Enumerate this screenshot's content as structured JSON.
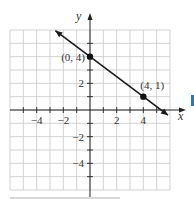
{
  "figure": {
    "type": "coordinate-graph",
    "axes": {
      "x_label": "x",
      "y_label": "y",
      "x_range": [
        -6,
        6
      ],
      "y_range": [
        -6,
        6
      ],
      "x_tick_labels": [
        {
          "value": -4,
          "label": "−4"
        },
        {
          "value": -2,
          "label": "−2"
        },
        {
          "value": 2,
          "label": "2"
        },
        {
          "value": 4,
          "label": "4"
        }
      ],
      "y_tick_labels": [
        {
          "value": 2,
          "label": "2"
        },
        {
          "value": -2,
          "label": "−2"
        },
        {
          "value": -4,
          "label": "−4"
        }
      ],
      "grid": true
    },
    "line": {
      "slope": -0.75,
      "intercept": 4,
      "from": [
        -2.6,
        5.95
      ],
      "to": [
        5.85,
        -0.39
      ],
      "arrows": "both",
      "color": "#1a1a1a"
    },
    "points": [
      {
        "x": 0,
        "y": 4,
        "label": "(0, 4)"
      },
      {
        "x": 4,
        "y": 1,
        "label": "(4, 1)"
      }
    ],
    "colors": {
      "grid": "#c8c8c8",
      "axis": "#222222",
      "text": "#333333",
      "side_marker": "#2f78b8"
    }
  }
}
